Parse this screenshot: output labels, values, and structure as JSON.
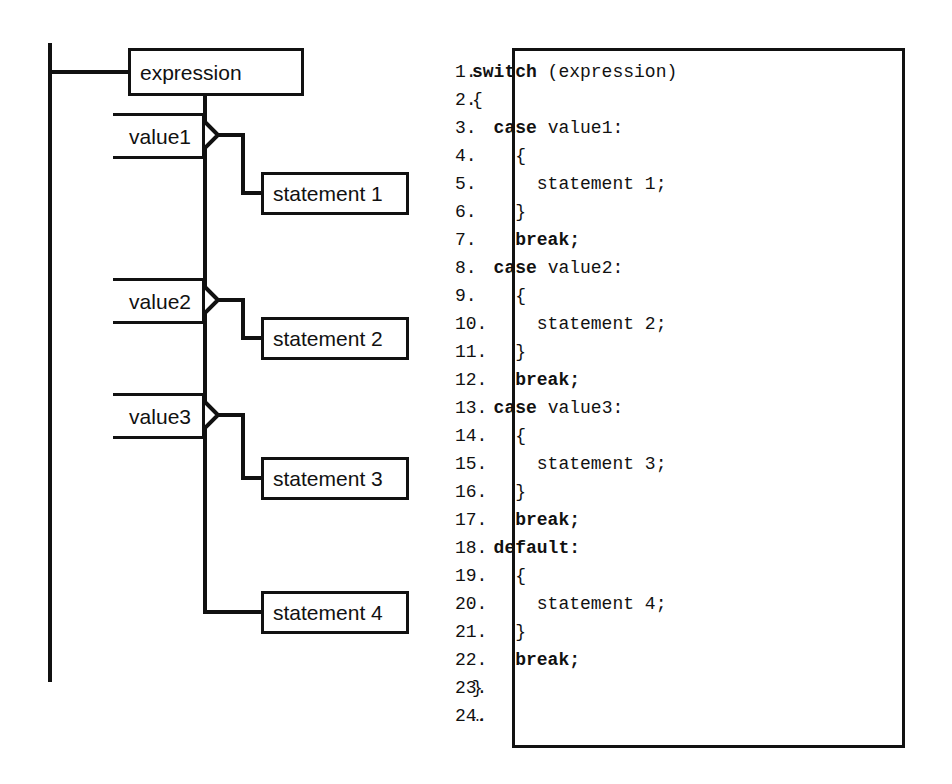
{
  "diagram": {
    "root": {
      "label": "expression"
    },
    "branches": [
      {
        "value_label": "value1",
        "statement_label": "statement 1"
      },
      {
        "value_label": "value2",
        "statement_label": "statement 2"
      },
      {
        "value_label": "value3",
        "statement_label": "statement 3"
      }
    ],
    "default_branch": {
      "statement_label": "statement 4"
    },
    "line_color": "#111111",
    "background": "#ffffff"
  },
  "code": {
    "line_numbers": [
      "1.",
      "2.",
      "3.",
      "4.",
      "5.",
      "6.",
      "7.",
      "8.",
      "9.",
      "10.",
      "11.",
      "12.",
      "13.",
      "14.",
      "15.",
      "16.",
      "17.",
      "18.",
      "19.",
      "20.",
      "21.",
      "22.",
      "23.",
      "24."
    ],
    "lines": [
      {
        "n": "1.",
        "indent": "",
        "keyword": "switch",
        "rest": " (expression)"
      },
      {
        "n": "2.",
        "indent": "",
        "keyword": "",
        "rest": "{"
      },
      {
        "n": "3.",
        "indent": "  ",
        "keyword": "case",
        "rest": " value1:"
      },
      {
        "n": "4.",
        "indent": "    ",
        "keyword": "",
        "rest": "{"
      },
      {
        "n": "5.",
        "indent": "      ",
        "keyword": "",
        "rest": "statement 1;"
      },
      {
        "n": "6.",
        "indent": "    ",
        "keyword": "",
        "rest": "}"
      },
      {
        "n": "7.",
        "indent": "    ",
        "keyword": "break;",
        "rest": ""
      },
      {
        "n": "8.",
        "indent": "  ",
        "keyword": "case",
        "rest": " value2:"
      },
      {
        "n": "9.",
        "indent": "    ",
        "keyword": "",
        "rest": "{"
      },
      {
        "n": "10.",
        "indent": "      ",
        "keyword": "",
        "rest": "statement 2;"
      },
      {
        "n": "11.",
        "indent": "    ",
        "keyword": "",
        "rest": "}"
      },
      {
        "n": "12.",
        "indent": "    ",
        "keyword": "break;",
        "rest": ""
      },
      {
        "n": "13.",
        "indent": "  ",
        "keyword": "case",
        "rest": " value3:"
      },
      {
        "n": "14.",
        "indent": "    ",
        "keyword": "",
        "rest": "{"
      },
      {
        "n": "15.",
        "indent": "      ",
        "keyword": "",
        "rest": "statement 3;"
      },
      {
        "n": "16.",
        "indent": "    ",
        "keyword": "",
        "rest": "}"
      },
      {
        "n": "17.",
        "indent": "    ",
        "keyword": "break;",
        "rest": ""
      },
      {
        "n": "18.",
        "indent": "  ",
        "keyword": "default:",
        "rest": ""
      },
      {
        "n": "19.",
        "indent": "    ",
        "keyword": "",
        "rest": "{"
      },
      {
        "n": "20.",
        "indent": "      ",
        "keyword": "",
        "rest": "statement 4;"
      },
      {
        "n": "21.",
        "indent": "    ",
        "keyword": "",
        "rest": "}"
      },
      {
        "n": "22.",
        "indent": "    ",
        "keyword": "break;",
        "rest": ""
      },
      {
        "n": "23.",
        "indent": "",
        "keyword": "",
        "rest": "}"
      },
      {
        "n": "24.",
        "indent": "",
        "keyword": "",
        "rest": "…"
      }
    ]
  }
}
